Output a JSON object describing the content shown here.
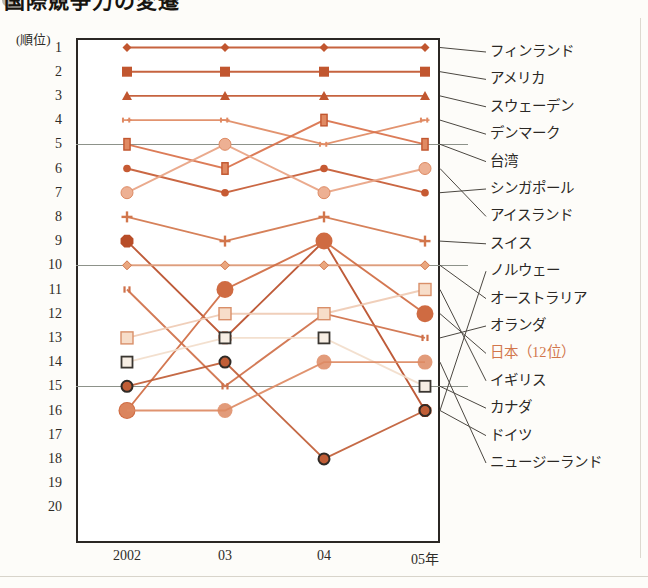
{
  "header": {
    "title": "国際競争力の変遷",
    "bullet_left": "●",
    "bullet_right": "●"
  },
  "axis": {
    "y_unit_label": "(順位)",
    "y_ticks": [
      "1",
      "2",
      "3",
      "4",
      "5",
      "6",
      "7",
      "8",
      "9",
      "10",
      "11",
      "12",
      "13",
      "14",
      "15",
      "16",
      "17",
      "18",
      "19",
      "20"
    ],
    "x_ticks": [
      "2002",
      "03",
      "04",
      "05年"
    ]
  },
  "chart_data": {
    "type": "line",
    "title": "国際競争力の変遷",
    "xlabel": "",
    "ylabel": "(順位)",
    "x": [
      "2002",
      "03",
      "04",
      "05年"
    ],
    "ylim": [
      1,
      20
    ],
    "y_inverted": true,
    "grid": true,
    "gridlines_at": [
      5,
      10,
      15
    ],
    "legend_position": "right",
    "series": [
      {
        "name": "フィンランド",
        "values": [
          1,
          1,
          1,
          1
        ],
        "marker": "diamond",
        "color": "#c1562f",
        "size": 9
      },
      {
        "name": "アメリカ",
        "values": [
          2,
          2,
          2,
          2
        ],
        "marker": "square",
        "color": "#c1562f",
        "size": 10
      },
      {
        "name": "スウェーデン",
        "values": [
          3,
          3,
          3,
          3
        ],
        "marker": "triangle",
        "color": "#c1562f",
        "size": 10
      },
      {
        "name": "デンマーク",
        "values": [
          4,
          4,
          5,
          4
        ],
        "marker": "h-bar",
        "color": "#e08a63",
        "size": 9
      },
      {
        "name": "台湾",
        "values": [
          5,
          6,
          4,
          5
        ],
        "marker": "v-rect",
        "color": "#d9714a",
        "size": 10
      },
      {
        "name": "シンガポール",
        "values": [
          6,
          7,
          6,
          7
        ],
        "marker": "circle-dark",
        "color": "#c65a33",
        "size": 9
      },
      {
        "name": "アイスランド",
        "values": [
          7,
          5,
          7,
          6
        ],
        "marker": "circle-pale",
        "color": "#e8a383",
        "size": 12
      },
      {
        "name": "スイス",
        "values": [
          8,
          9,
          8,
          9
        ],
        "marker": "plus",
        "color": "#d2764c",
        "size": 11
      },
      {
        "name": "ノルウェー",
        "values": [
          9,
          13,
          9,
          16
        ],
        "marker": "octagon",
        "color": "#b84d28",
        "size": 14
      },
      {
        "name": "オーストラリア",
        "values": [
          10,
          10,
          10,
          10
        ],
        "marker": "diamond-pale",
        "color": "#e39f7d",
        "size": 9
      },
      {
        "name": "オランダ",
        "values": [
          11,
          15,
          12,
          13
        ],
        "marker": "dbl-bar",
        "color": "#cf7049",
        "size": 9
      },
      {
        "name": "日本（12位）",
        "values": [
          16,
          11,
          9,
          12
        ],
        "marker": "circle-big",
        "color": "#cf6b42",
        "size": 17,
        "highlight": true
      },
      {
        "name": "イギリス",
        "values": [
          13,
          12,
          12,
          11
        ],
        "marker": "square-pale",
        "color": "#efcbb4",
        "size": 12
      },
      {
        "name": "カナダ",
        "values": [
          14,
          13,
          13,
          15
        ],
        "marker": "square-outline",
        "color": "#f2ddcb",
        "size": 11
      },
      {
        "name": "ドイツ",
        "values": [
          15,
          14,
          18,
          16
        ],
        "marker": "circle-ring",
        "color": "#c05d36",
        "size": 11
      },
      {
        "name": "ニュージーランド",
        "values": [
          16,
          16,
          14,
          14
        ],
        "marker": "circle-light",
        "color": "#dd8a63",
        "size": 15
      }
    ]
  },
  "legend": {
    "items": [
      {
        "label": "フィンランド",
        "rank_05": 1
      },
      {
        "label": "アメリカ",
        "rank_05": 2
      },
      {
        "label": "スウェーデン",
        "rank_05": 3
      },
      {
        "label": "デンマーク",
        "rank_05": 4
      },
      {
        "label": "台湾",
        "rank_05": 5
      },
      {
        "label": "シンガポール",
        "rank_05": 6
      },
      {
        "label": "アイスランド",
        "rank_05": 7
      },
      {
        "label": "スイス",
        "rank_05": 8
      },
      {
        "label": "ノルウェー",
        "rank_05": 9
      },
      {
        "label": "オーストラリア",
        "rank_05": 10
      },
      {
        "label": "オランダ",
        "rank_05": 11
      },
      {
        "label": "日本（12位）",
        "rank_05": 12,
        "highlight": true
      },
      {
        "label": "イギリス",
        "rank_05": 13
      },
      {
        "label": "カナダ",
        "rank_05": 14
      },
      {
        "label": "ドイツ",
        "rank_05": 15
      },
      {
        "label": "ニュージーランド",
        "rank_05": 16
      }
    ]
  },
  "colors": {
    "accent": "#c1562f",
    "japan": "#d2764c",
    "frame": "#2b2724",
    "grid": "#8d928a",
    "text": "#2e2b27"
  }
}
